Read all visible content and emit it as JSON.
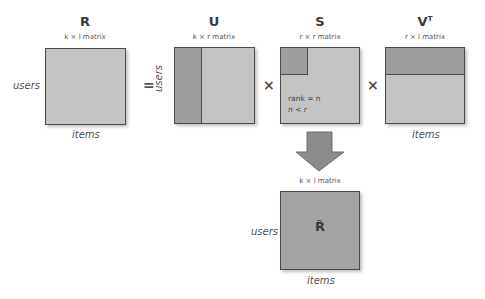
{
  "matrices": {
    "R": {
      "title": "R",
      "dims": "k × l matrix",
      "row_label": "users",
      "col_label": "items"
    },
    "U": {
      "title": "U",
      "dims": "k × r matrix",
      "row_label": "users"
    },
    "S": {
      "title": "S",
      "dims": "r × r matrix",
      "note_line1": "rank = n",
      "note_line2": "n < r"
    },
    "VT": {
      "title": "V",
      "title_sup": "T",
      "dims": "r × l matrix",
      "col_label": "items"
    },
    "R_hat": {
      "title": "R̂",
      "dims": "k × l matrix",
      "row_label": "users",
      "col_label": "items"
    }
  },
  "operators": {
    "equals": "=",
    "times1": "×",
    "times2": "×"
  },
  "colors": {
    "light": "#c3c3c3",
    "dark": "#9e9e9e",
    "border": "#4a4a4a",
    "arrow": "#8c8c8c"
  }
}
